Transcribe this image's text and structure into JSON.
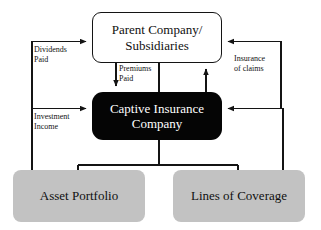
{
  "diagram": {
    "nodes": {
      "parent": {
        "label": "Parent Company/\nSubsidiaries",
        "fill": "#ffffff",
        "text_color": "#101010",
        "shape": "rounded-rectangle"
      },
      "captive": {
        "label": "Captive Insurance\nCompany",
        "fill": "#050505",
        "text_color": "#ffffff",
        "shape": "rounded-rectangle"
      },
      "asset_portfolio": {
        "label": "Asset Portfolio",
        "fill": "#c2c2c2",
        "text_color": "#101010",
        "shape": "rounded-rectangle"
      },
      "lines_of_coverage": {
        "label": "Lines of Coverage",
        "fill": "#c2c2c2",
        "text_color": "#101010",
        "shape": "rounded-rectangle"
      }
    },
    "edge_labels": {
      "dividends_paid": "Dividends\nPaid",
      "investment_income": "Investment\nIncome",
      "premiums_paid": "Premiums\nPaid",
      "insurance_of_claims": "Insurance\nof claims"
    },
    "edges": [
      {
        "name": "dividends-paid",
        "from": "captive",
        "to": "parent",
        "label": "Dividends Paid",
        "direction": "right-arrow"
      },
      {
        "name": "premiums-paid",
        "from": "parent",
        "to": "captive",
        "label": "Premiums Paid",
        "direction": "down-arrow"
      },
      {
        "name": "parent-captive-link",
        "from": "parent",
        "to": "captive",
        "label": "",
        "direction": "plain"
      },
      {
        "name": "claims-payment",
        "from": "captive",
        "to": "parent",
        "label": "",
        "direction": "up-arrow"
      },
      {
        "name": "insurance-of-claims",
        "from": "lines_of_coverage",
        "to": "parent",
        "label": "Insurance of claims",
        "direction": "left-arrow"
      },
      {
        "name": "coverage-to-captive",
        "from": "lines_of_coverage",
        "to": "captive",
        "label": "",
        "direction": "left-arrow"
      },
      {
        "name": "investment-income",
        "from": "asset_portfolio",
        "to": "captive",
        "label": "Investment Income",
        "direction": "right-arrow"
      },
      {
        "name": "captive-to-portfolios",
        "from": "captive",
        "to": "asset_portfolio",
        "label": "",
        "direction": "plain"
      }
    ],
    "stroke_color": "#141414"
  }
}
